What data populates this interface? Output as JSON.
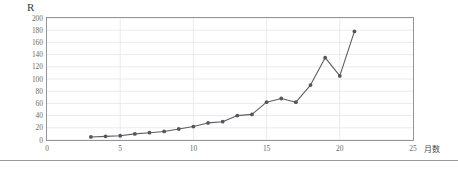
{
  "chart_data": {
    "type": "line",
    "title": "R",
    "xlabel": "月数",
    "ylabel": "",
    "x": [
      3,
      4,
      5,
      6,
      7,
      8,
      9,
      10,
      11,
      12,
      13,
      14,
      15,
      16,
      17,
      18,
      19,
      20,
      21
    ],
    "values": [
      5,
      6,
      7,
      10,
      12,
      14,
      18,
      22,
      28,
      30,
      40,
      42,
      62,
      68,
      62,
      90,
      135,
      105,
      178
    ],
    "series": [
      {
        "name": "R",
        "values": [
          5,
          6,
          7,
          10,
          12,
          14,
          18,
          22,
          28,
          30,
          40,
          42,
          62,
          68,
          62,
          90,
          135,
          105,
          178
        ]
      }
    ],
    "xlim": [
      0,
      25
    ],
    "ylim": [
      0,
      200
    ],
    "xticks": [
      0,
      5,
      10,
      15,
      20,
      25
    ],
    "yticks": [
      0,
      20,
      40,
      60,
      80,
      100,
      120,
      140,
      160,
      180,
      200
    ],
    "xtick_labels": [
      "0",
      "5",
      "10",
      "15",
      "20",
      "25"
    ],
    "ytick_labels": [
      "0",
      "20",
      "40",
      "60",
      "80",
      "100",
      "120",
      "140",
      "160",
      "180",
      "200"
    ],
    "grid": true,
    "grid_axis": "both",
    "legend": false,
    "marker": "circle",
    "line_color": "#5d5d66",
    "marker_color": "#55555e",
    "grid_color": "#e2e2e8",
    "border_color": "#8a8a8a",
    "text_color": "#6a6a6a"
  }
}
